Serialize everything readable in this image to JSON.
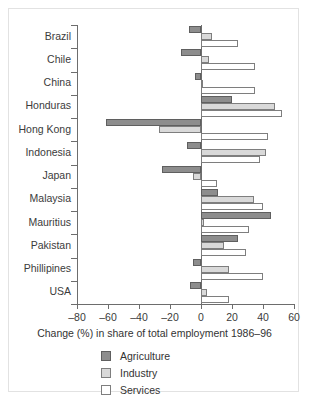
{
  "chart_data": {
    "type": "bar",
    "orientation": "horizontal",
    "title": "",
    "xlabel": "Change (%) in share of total employment 1986–96",
    "ylabel": "",
    "xlim": [
      -80,
      60
    ],
    "xticks": [
      -80,
      -60,
      -40,
      -20,
      0,
      20,
      40,
      60
    ],
    "xticklabels": [
      "–80",
      "–60",
      "–40",
      "–20",
      "0",
      "20",
      "40",
      "60"
    ],
    "grid": false,
    "legend_position": "below-axis-left",
    "categories": [
      "Brazil",
      "Chile",
      "China",
      "Honduras",
      "Hong Kong",
      "Indonesia",
      "Japan",
      "Malaysia",
      "Mauritius",
      "Pakistan",
      "Phillipines",
      "USA"
    ],
    "series": [
      {
        "name": "Agriculture",
        "color": "#8d8d8d",
        "values": [
          -8,
          -13,
          -4,
          20,
          -61,
          -9,
          -25,
          11,
          45,
          24,
          -5,
          -7
        ]
      },
      {
        "name": "Industry",
        "color": "#d9d9d9",
        "values": [
          7,
          5,
          0,
          48,
          -27,
          42,
          -5,
          34,
          2,
          15,
          18,
          4
        ]
      },
      {
        "name": "Services",
        "color": "#ffffff",
        "values": [
          24,
          35,
          35,
          52,
          43,
          38,
          10,
          40,
          31,
          29,
          40,
          18
        ]
      }
    ]
  },
  "legend": {
    "items": [
      {
        "label": "Agriculture",
        "key": "agriculture"
      },
      {
        "label": "Industry",
        "key": "industry"
      },
      {
        "label": "Services",
        "key": "services"
      }
    ]
  }
}
